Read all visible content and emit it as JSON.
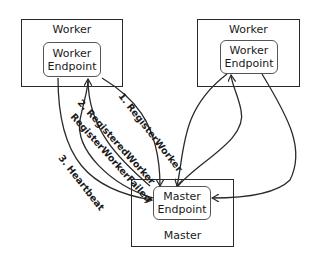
{
  "diagram": {
    "type": "architecture",
    "nodes": {
      "worker_left": {
        "title": "Worker",
        "endpoint_line1": "Worker",
        "endpoint_line2": "Endpoint"
      },
      "worker_right": {
        "title": "Worker",
        "endpoint_line1": "Worker",
        "endpoint_line2": "Endpoint"
      },
      "master": {
        "title": "Master",
        "endpoint_line1": "Master",
        "endpoint_line2": "Endpoint"
      }
    },
    "edges": [
      {
        "from": "worker_left",
        "to": "master",
        "label": "1. RegisterWorker"
      },
      {
        "from": "master",
        "to": "worker_left",
        "label": "2. RegisteredWorker"
      },
      {
        "from": "master",
        "to": "worker_left",
        "label": "RegisterWorkerFailed"
      },
      {
        "from": "worker_left",
        "to": "master",
        "label": "3. Heartbeat"
      },
      {
        "from": "worker_right",
        "to": "master",
        "label": ""
      },
      {
        "from": "master",
        "to": "worker_right",
        "label": ""
      },
      {
        "from": "worker_right",
        "to": "master",
        "label": ""
      }
    ],
    "colors": {
      "line": "#2a2a2a",
      "background": "#ffffff"
    }
  }
}
